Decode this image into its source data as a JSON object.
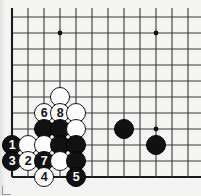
{
  "figure": {
    "board": {
      "lines": {
        "columns": [
          12,
          28,
          44,
          60,
          76,
          92,
          108,
          124,
          140,
          156,
          172,
          188
        ],
        "rows": [
          17,
          33,
          49,
          65,
          81,
          97,
          113,
          129,
          145,
          161,
          177
        ],
        "left_edge_col": 0,
        "bottom_edge_row": 10,
        "line_color": "#3a3a3a",
        "edge_color": "#1a1a1a",
        "background": "#f4f4f2"
      },
      "star_points": [
        {
          "col": 3,
          "row": 1
        },
        {
          "col": 9,
          "row": 1
        },
        {
          "col": 9,
          "row": 7
        }
      ],
      "star_color": "#111111"
    },
    "stones": [
      {
        "col": 3,
        "row": 5,
        "color": "white",
        "label": ""
      },
      {
        "col": 2,
        "row": 6,
        "color": "white",
        "label": "6"
      },
      {
        "col": 3,
        "row": 6,
        "color": "white",
        "label": "8"
      },
      {
        "col": 4,
        "row": 6,
        "color": "white",
        "label": ""
      },
      {
        "col": 2,
        "row": 7,
        "color": "black",
        "label": ""
      },
      {
        "col": 3,
        "row": 7,
        "color": "black",
        "label": ""
      },
      {
        "col": 4,
        "row": 7,
        "color": "white",
        "label": ""
      },
      {
        "col": 7,
        "row": 7,
        "color": "black",
        "label": ""
      },
      {
        "col": 0,
        "row": 8,
        "color": "black",
        "label": "1"
      },
      {
        "col": 1,
        "row": 8,
        "color": "white",
        "label": ""
      },
      {
        "col": 2,
        "row": 8,
        "color": "white",
        "label": ""
      },
      {
        "col": 3,
        "row": 8,
        "color": "black",
        "label": ""
      },
      {
        "col": 4,
        "row": 8,
        "color": "black",
        "label": ""
      },
      {
        "col": 9,
        "row": 8,
        "color": "black",
        "label": ""
      },
      {
        "col": 0,
        "row": 9,
        "color": "black",
        "label": "3"
      },
      {
        "col": 1,
        "row": 9,
        "color": "white",
        "label": "2"
      },
      {
        "col": 2,
        "row": 9,
        "color": "black",
        "label": "7"
      },
      {
        "col": 3,
        "row": 9,
        "color": "white",
        "label": ""
      },
      {
        "col": 4,
        "row": 9,
        "color": "black",
        "label": ""
      },
      {
        "col": 2,
        "row": 10,
        "color": "white",
        "label": "4"
      },
      {
        "col": 4,
        "row": 10,
        "color": "black",
        "label": "5"
      }
    ],
    "move_numbers": {
      "black": [
        "1",
        "3",
        "5",
        "7"
      ],
      "white": [
        "2",
        "4",
        "6",
        "8"
      ]
    }
  }
}
